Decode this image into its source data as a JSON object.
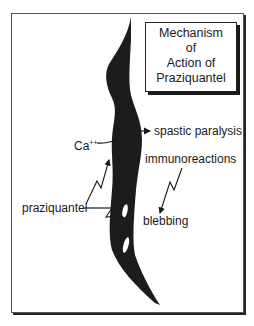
{
  "title": {
    "lines": [
      "Mechanism",
      "of",
      "Action of",
      "Praziquantel"
    ]
  },
  "labels": {
    "spastic_paralysis": "spastic paralysis",
    "calcium": "Ca",
    "calcium_charge": "++",
    "immunoreactions": "immunoreactions",
    "praziquantel": "praziquantel",
    "blebbing": "blebbing"
  },
  "colors": {
    "worm": "#1c1c1c",
    "frame": "#555555",
    "text": "#1a1a1a",
    "background": "#ffffff"
  }
}
